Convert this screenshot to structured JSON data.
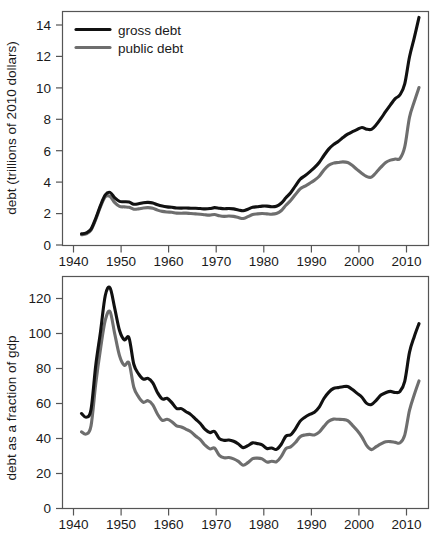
{
  "figure": {
    "background": "#ffffff",
    "colors": {
      "gross_debt": "#111111",
      "public_debt": "#6e6e6e",
      "axis": "#555555",
      "text": "#1a1a1a"
    }
  },
  "legend": {
    "position": "top-left",
    "entries": [
      {
        "label": "gross debt",
        "color": "#111111"
      },
      {
        "label": "public debt",
        "color": "#6e6e6e"
      }
    ]
  },
  "chart_data": [
    {
      "type": "line",
      "title": "",
      "xlabel": "",
      "ylabel": "debt (trillions of 2010 dollars)",
      "xlim": [
        1936,
        2013
      ],
      "ylim": [
        0,
        15
      ],
      "xticks": [
        1940,
        1950,
        1960,
        1970,
        1980,
        1990,
        2000,
        2010
      ],
      "xticklabels": [
        "1940",
        "1950",
        "1960",
        "1970",
        "1980",
        "1990",
        "2000",
        "2010"
      ],
      "yticks": [
        0,
        2,
        4,
        6,
        8,
        10,
        12,
        14
      ],
      "yticklabels": [
        "0",
        "2",
        "4",
        "6",
        "8",
        "10",
        "12",
        "14"
      ],
      "grid": false,
      "legend_position": "upper left",
      "x": [
        1940,
        1941,
        1942,
        1943,
        1944,
        1945,
        1946,
        1947,
        1948,
        1949,
        1950,
        1951,
        1952,
        1953,
        1954,
        1955,
        1956,
        1957,
        1958,
        1959,
        1960,
        1961,
        1962,
        1963,
        1964,
        1965,
        1966,
        1967,
        1968,
        1969,
        1970,
        1971,
        1972,
        1973,
        1974,
        1975,
        1976,
        1977,
        1978,
        1979,
        1980,
        1981,
        1982,
        1983,
        1984,
        1985,
        1986,
        1987,
        1988,
        1989,
        1990,
        1991,
        1992,
        1993,
        1994,
        1995,
        1996,
        1997,
        1998,
        1999,
        2000,
        2001,
        2002,
        2003,
        2004,
        2005,
        2006,
        2007,
        2008,
        2009,
        2010,
        2011
      ],
      "series": [
        {
          "name": "gross debt",
          "color": "#111111",
          "values": [
            0.72,
            0.78,
            1.02,
            1.72,
            2.55,
            3.22,
            3.38,
            3.02,
            2.8,
            2.78,
            2.76,
            2.62,
            2.65,
            2.72,
            2.74,
            2.7,
            2.58,
            2.5,
            2.45,
            2.42,
            2.38,
            2.37,
            2.38,
            2.36,
            2.36,
            2.34,
            2.32,
            2.34,
            2.4,
            2.36,
            2.33,
            2.34,
            2.32,
            2.25,
            2.2,
            2.3,
            2.42,
            2.46,
            2.5,
            2.5,
            2.46,
            2.49,
            2.68,
            3.03,
            3.36,
            3.8,
            4.22,
            4.45,
            4.7,
            4.97,
            5.3,
            5.75,
            6.16,
            6.45,
            6.65,
            6.9,
            7.12,
            7.28,
            7.42,
            7.55,
            7.44,
            7.43,
            7.72,
            8.13,
            8.58,
            9.0,
            9.4,
            9.65,
            10.35,
            12.08,
            13.3,
            14.62
          ]
        },
        {
          "name": "public debt",
          "color": "#6e6e6e",
          "values": [
            0.66,
            0.72,
            0.96,
            1.64,
            2.46,
            3.1,
            3.12,
            2.72,
            2.48,
            2.45,
            2.42,
            2.3,
            2.32,
            2.38,
            2.4,
            2.36,
            2.24,
            2.16,
            2.12,
            2.1,
            2.05,
            2.04,
            2.05,
            2.02,
            2.0,
            1.98,
            1.94,
            1.92,
            1.96,
            1.88,
            1.84,
            1.86,
            1.84,
            1.76,
            1.7,
            1.82,
            1.96,
            2.0,
            2.02,
            2.0,
            1.98,
            2.02,
            2.2,
            2.55,
            2.86,
            3.24,
            3.6,
            3.78,
            3.96,
            4.16,
            4.42,
            4.82,
            5.12,
            5.26,
            5.3,
            5.34,
            5.3,
            5.1,
            4.84,
            4.6,
            4.4,
            4.36,
            4.66,
            5.0,
            5.3,
            5.45,
            5.52,
            5.56,
            6.3,
            8.2,
            9.2,
            10.12
          ]
        }
      ]
    },
    {
      "type": "line",
      "title": "",
      "xlabel": "",
      "ylabel": "debt as a fraction of gdp",
      "xlim": [
        1936,
        2013
      ],
      "ylim": [
        0,
        128
      ],
      "xticks": [
        1940,
        1950,
        1960,
        1970,
        1980,
        1990,
        2000,
        2010
      ],
      "xticklabels": [
        "1940",
        "1950",
        "1960",
        "1970",
        "1980",
        "1990",
        "2000",
        "2010"
      ],
      "yticks": [
        0,
        20,
        40,
        60,
        80,
        100,
        120
      ],
      "yticklabels": [
        "0",
        "20",
        "40",
        "60",
        "80",
        "100",
        "120"
      ],
      "grid": false,
      "legend_position": "none",
      "x": [
        1940,
        1941,
        1942,
        1943,
        1944,
        1945,
        1946,
        1947,
        1948,
        1949,
        1950,
        1951,
        1952,
        1953,
        1954,
        1955,
        1956,
        1957,
        1958,
        1959,
        1960,
        1961,
        1962,
        1963,
        1964,
        1965,
        1966,
        1967,
        1968,
        1969,
        1970,
        1971,
        1972,
        1973,
        1974,
        1975,
        1976,
        1977,
        1978,
        1979,
        1980,
        1981,
        1982,
        1983,
        1984,
        1985,
        1986,
        1987,
        1988,
        1989,
        1990,
        1991,
        1992,
        1993,
        1994,
        1995,
        1996,
        1997,
        1998,
        1999,
        2000,
        2001,
        2002,
        2003,
        2004,
        2005,
        2006,
        2007,
        2008,
        2009,
        2010,
        2011
      ],
      "series": [
        {
          "name": "gross debt",
          "color": "#111111",
          "values": [
            52.4,
            50.4,
            54.6,
            79.1,
            97.6,
            117.5,
            121.7,
            110.3,
            98.2,
            93.1,
            94.1,
            79.6,
            74.3,
            71.4,
            71.8,
            69.3,
            63.9,
            60.4,
            60.8,
            58.4,
            55.2,
            55.1,
            53.4,
            51.8,
            49.3,
            46.9,
            43.6,
            41.9,
            42.5,
            38.6,
            37.6,
            37.8,
            37.1,
            35.6,
            33.6,
            34.7,
            36.2,
            35.8,
            35.1,
            33.1,
            33.4,
            32.6,
            35.3,
            39.9,
            40.7,
            43.9,
            48.2,
            50.4,
            51.9,
            53.1,
            55.9,
            60.7,
            64.1,
            66.2,
            66.7,
            67.2,
            67.3,
            65.6,
            63.5,
            61.4,
            58.0,
            57.4,
            59.7,
            62.6,
            63.9,
            64.6,
            64.0,
            64.6,
            70.2,
            86.1,
            94.8,
            102.0
          ]
        },
        {
          "name": "public debt",
          "color": "#6e6e6e",
          "values": [
            42.3,
            41.1,
            45.6,
            68.9,
            88.1,
            103.9,
            108.6,
            96.2,
            84.3,
            79.0,
            80.2,
            66.9,
            61.6,
            58.6,
            59.5,
            57.2,
            52.0,
            48.6,
            49.2,
            47.9,
            45.6,
            45.0,
            43.7,
            42.4,
            40.0,
            38.0,
            34.9,
            32.9,
            33.3,
            29.3,
            28.0,
            28.1,
            27.4,
            26.0,
            23.9,
            25.3,
            27.5,
            27.8,
            27.4,
            25.6,
            26.1,
            25.8,
            28.6,
            33.0,
            34.0,
            36.4,
            39.6,
            40.6,
            40.9,
            40.6,
            42.1,
            45.3,
            48.1,
            49.3,
            49.2,
            49.1,
            48.5,
            45.9,
            43.0,
            39.4,
            34.7,
            32.5,
            34.1,
            35.6,
            36.8,
            36.9,
            36.5,
            36.2,
            40.5,
            54.1,
            62.8,
            70.4
          ]
        }
      ]
    }
  ]
}
